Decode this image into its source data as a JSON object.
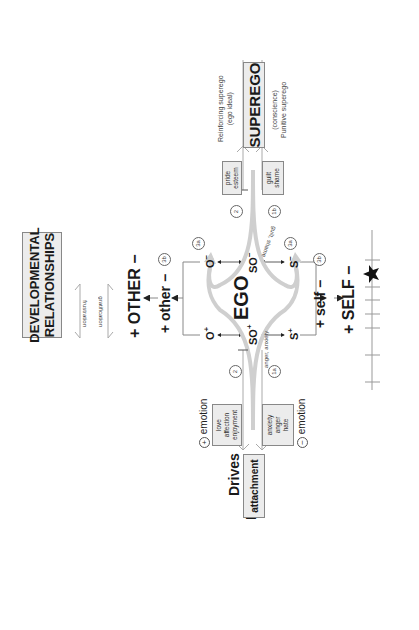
{
  "title": {
    "line1": "DEVELOPMENTAL",
    "line2": "RELATIONSHIPS"
  },
  "relations": {
    "frustration": "frustration",
    "gratification": "gratification"
  },
  "other": {
    "upper": "+ OTHER −",
    "lower": "+ other −",
    "lower_marker": "3b"
  },
  "self": {
    "lower": "+ self −",
    "lower_marker": "3b",
    "upper": "+ SELF −"
  },
  "ego": {
    "label": "EGO",
    "negative_row": [
      {
        "base": "O",
        "sign": "−"
      },
      {
        "base": "SO",
        "sign": "−"
      },
      {
        "base": "S",
        "sign": "−"
      }
    ],
    "positive_row": [
      {
        "base": "O",
        "sign": "+"
      },
      {
        "base": "SO",
        "sign": "+"
      },
      {
        "base": "S",
        "sign": "+"
      }
    ],
    "markers": [
      "3a",
      "3a"
    ]
  },
  "superego": {
    "label": "SUPEREGO",
    "upper_note_1": "Reinforcing superego",
    "upper_note_2": "(ego ideal)",
    "lower_note_1": "(conscience)",
    "lower_note_2": "Punitive superego",
    "pos_box": [
      "pride",
      "esteem"
    ],
    "neg_box": [
      "guilt",
      "shame"
    ],
    "marker_2": "2",
    "marker_1b": "1b",
    "path_label": "guilt, shame"
  },
  "id": {
    "id_label": "ID",
    "drives_label": "Drives",
    "box_label": "attachment",
    "pos_emotion_sign": "+",
    "pos_emotion": "emotion",
    "neg_emotion_sign": "−",
    "neg_emotion": "emotion",
    "pos_box": [
      "love",
      "affection",
      "enjoyment"
    ],
    "neg_box": [
      "anxiety",
      "anger",
      "hate"
    ],
    "marker_2": "2",
    "marker_1a": "1a",
    "path_label": "anger, anxiety"
  },
  "scale": {
    "marker_icon": "star-icon",
    "ticks": 8
  }
}
